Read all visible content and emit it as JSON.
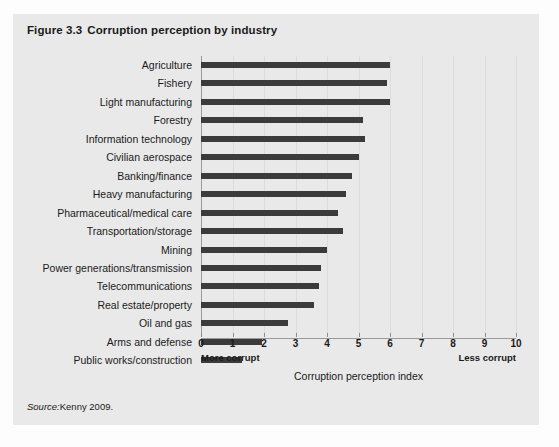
{
  "figure": {
    "number": "Figure 3.3",
    "title": "Corruption perception by industry",
    "source_label": "Source:",
    "source_text": "Kenny 2009.",
    "panel_color": "#e9e9e9",
    "bar_color": "#3b3b3b"
  },
  "axis": {
    "more_corrupt_label": "More corrupt",
    "less_corrupt_label": "Less corrupt",
    "x_title": "Corruption perception index",
    "ticks": [
      "0",
      "1",
      "2",
      "3",
      "4",
      "5",
      "6",
      "7",
      "8",
      "9",
      "10"
    ]
  },
  "chart_data": {
    "type": "bar",
    "orientation": "horizontal",
    "xlabel": "Corruption perception index",
    "ylabel": "",
    "xlim": [
      0,
      10
    ],
    "grid": true,
    "legend": null,
    "annotations": [
      "More corrupt",
      "Less corrupt"
    ],
    "source": "Source: Kenny 2009.",
    "categories": [
      "Agriculture",
      "Fishery",
      "Light manufacturing",
      "Forestry",
      "Information technology",
      "Civilian aerospace",
      "Banking/finance",
      "Heavy manufacturing",
      "Pharmaceutical/medical care",
      "Transportation/storage",
      "Mining",
      "Power generations/transmission",
      "Telecommunications",
      "Real estate/property",
      "Oil and gas",
      "Arms and defense",
      "Public works/construction"
    ],
    "values": [
      6.0,
      5.9,
      6.0,
      5.15,
      5.2,
      5.0,
      4.8,
      4.6,
      4.35,
      4.5,
      4.0,
      3.8,
      3.75,
      3.6,
      2.75,
      1.95,
      1.3
    ]
  }
}
